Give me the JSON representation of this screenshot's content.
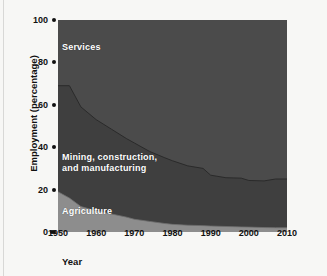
{
  "chart_data": {
    "type": "area",
    "stacked": true,
    "title": "",
    "xlabel": "Year",
    "ylabel": "Employment (percentage)",
    "xlim": [
      1950,
      2010
    ],
    "ylim": [
      0,
      100
    ],
    "grid": false,
    "legend_position": "inline-labels",
    "xticks": [
      1950,
      1960,
      1970,
      1980,
      1990,
      2000,
      2010
    ],
    "xtick_labels": [
      "1950",
      "1960",
      "1970",
      "1980",
      "1990",
      "2000",
      "2010"
    ],
    "yticks": [
      0,
      20,
      40,
      60,
      80,
      100
    ],
    "ytick_labels": [
      "0",
      "20",
      "40",
      "60",
      "80",
      "100"
    ],
    "x": [
      1950,
      1953,
      1956,
      1960,
      1964,
      1968,
      1970,
      1974,
      1978,
      1980,
      1984,
      1988,
      1990,
      1994,
      1998,
      2000,
      2004,
      2007
    ],
    "series": [
      {
        "name": "Agriculture",
        "color": "#8d8d8d",
        "values": [
          19,
          16,
          12,
          10,
          8.5,
          7,
          6,
          5,
          4,
          3.6,
          3.2,
          3,
          2.8,
          2.6,
          2.4,
          2.3,
          2.1,
          2
        ]
      },
      {
        "name": "Mining, construction, and manufacturing",
        "color": "#3f3f3f",
        "values": [
          50,
          53,
          47,
          43,
          40,
          37,
          36,
          33,
          31,
          30,
          28,
          27,
          24,
          23,
          23,
          22,
          22,
          23
        ]
      },
      {
        "name": "Services",
        "color": "#4b4b4b",
        "values": [
          31,
          31,
          41,
          47,
          51.5,
          56,
          58,
          62,
          65,
          66.4,
          68.8,
          70,
          73.2,
          74.4,
          74.6,
          75.7,
          75.9,
          75
        ]
      }
    ],
    "annotations": [
      {
        "text": "Services",
        "x": 1951.5,
        "y": 88
      },
      {
        "text": "Mining, construction,",
        "x": 1951.5,
        "y": 37
      },
      {
        "text": "and manufacturing",
        "x": 1951.5,
        "y": 32
      },
      {
        "text": "Agriculture",
        "x": 1951.5,
        "y": 11
      }
    ]
  },
  "labels": {
    "services": "Services",
    "mining_line1": "Mining, construction,",
    "mining_line2": "and manufacturing",
    "agriculture": "Agriculture"
  },
  "axes": {
    "y_title": "Employment (percentage)",
    "x_title": "Year",
    "y_ticks": [
      "100",
      "80",
      "60",
      "40",
      "20",
      "0"
    ],
    "x_ticks": [
      "1950",
      "1960",
      "1970",
      "1980",
      "1990",
      "2000",
      "2010"
    ]
  },
  "colors": {
    "services": "#4b4b4b",
    "mining": "#3f3f3f",
    "agriculture": "#8d8d8d",
    "background": "#f7f7f5",
    "text": "#111111",
    "label_text": "#ffffff"
  }
}
